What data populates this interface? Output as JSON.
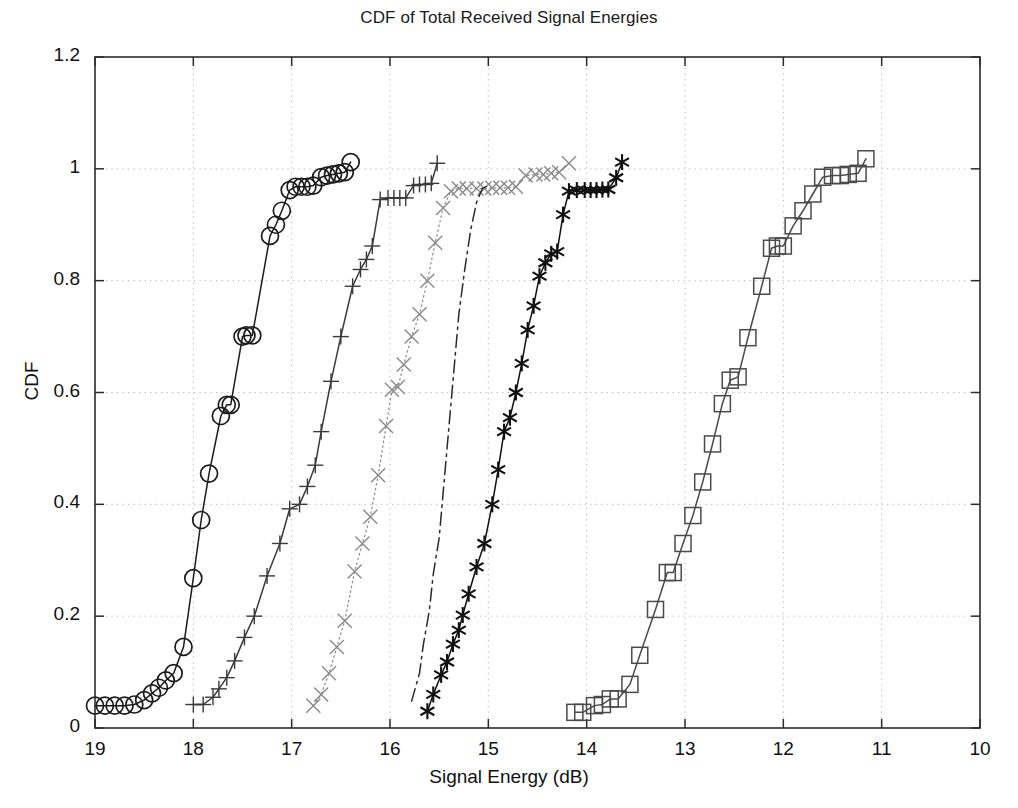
{
  "chart_data": {
    "type": "line",
    "title": "CDF of Total Received Signal Energies",
    "xlabel": "Signal Energy (dB)",
    "ylabel": "CDF",
    "xlim": [
      19,
      10
    ],
    "ylim": [
      0,
      1.2
    ],
    "x_inverted": true,
    "grid": true,
    "legend": "none",
    "xticks": [
      19,
      18,
      17,
      16,
      15,
      14,
      13,
      12,
      11,
      10
    ],
    "xtick_labels": [
      "19",
      "18",
      "17",
      "16",
      "15",
      "14",
      "13",
      "12",
      "11",
      "10"
    ],
    "yticks": [
      0,
      0.2,
      0.4,
      0.6,
      0.8,
      1,
      1.2
    ],
    "ytick_labels": [
      "0",
      "0.2",
      "0.4",
      "0.6",
      "0.8",
      "1",
      "1.2"
    ],
    "series": [
      {
        "name": "series-1",
        "marker": "circle",
        "linestyle": "solid",
        "color": "#1b1b1b",
        "points": [
          [
            19.0,
            0.04
          ],
          [
            18.9,
            0.04
          ],
          [
            18.8,
            0.04
          ],
          [
            18.7,
            0.04
          ],
          [
            18.6,
            0.042
          ],
          [
            18.5,
            0.05
          ],
          [
            18.42,
            0.062
          ],
          [
            18.35,
            0.072
          ],
          [
            18.28,
            0.085
          ],
          [
            18.2,
            0.098
          ],
          [
            18.1,
            0.145
          ],
          [
            18.0,
            0.268
          ],
          [
            17.92,
            0.372
          ],
          [
            17.84,
            0.455
          ],
          [
            17.72,
            0.558
          ],
          [
            17.66,
            0.578
          ],
          [
            17.62,
            0.578
          ],
          [
            17.5,
            0.7
          ],
          [
            17.46,
            0.702
          ],
          [
            17.4,
            0.702
          ],
          [
            17.22,
            0.88
          ],
          [
            17.16,
            0.9
          ],
          [
            17.1,
            0.925
          ],
          [
            17.02,
            0.962
          ],
          [
            16.96,
            0.968
          ],
          [
            16.9,
            0.968
          ],
          [
            16.84,
            0.968
          ],
          [
            16.78,
            0.97
          ],
          [
            16.7,
            0.985
          ],
          [
            16.64,
            0.988
          ],
          [
            16.58,
            0.99
          ],
          [
            16.52,
            0.992
          ],
          [
            16.46,
            0.994
          ],
          [
            16.4,
            1.012
          ]
        ]
      },
      {
        "name": "series-2",
        "marker": "plus",
        "linestyle": "solid",
        "color": "#3a3a3a",
        "points": [
          [
            18.0,
            0.042
          ],
          [
            17.9,
            0.042
          ],
          [
            17.8,
            0.055
          ],
          [
            17.74,
            0.07
          ],
          [
            17.66,
            0.09
          ],
          [
            17.58,
            0.12
          ],
          [
            17.48,
            0.162
          ],
          [
            17.38,
            0.2
          ],
          [
            17.25,
            0.272
          ],
          [
            17.12,
            0.33
          ],
          [
            17.02,
            0.392
          ],
          [
            16.92,
            0.4
          ],
          [
            16.84,
            0.432
          ],
          [
            16.76,
            0.47
          ],
          [
            16.7,
            0.53
          ],
          [
            16.6,
            0.62
          ],
          [
            16.5,
            0.7
          ],
          [
            16.38,
            0.79
          ],
          [
            16.3,
            0.82
          ],
          [
            16.24,
            0.838
          ],
          [
            16.18,
            0.862
          ],
          [
            16.1,
            0.945
          ],
          [
            16.02,
            0.948
          ],
          [
            15.96,
            0.948
          ],
          [
            15.9,
            0.948
          ],
          [
            15.84,
            0.948
          ],
          [
            15.76,
            0.97
          ],
          [
            15.7,
            0.972
          ],
          [
            15.64,
            0.972
          ],
          [
            15.58,
            0.974
          ],
          [
            15.52,
            1.01
          ]
        ]
      },
      {
        "name": "series-3",
        "marker": "x",
        "linestyle": "dotted",
        "color": "#8a8a8a",
        "points": [
          [
            16.78,
            0.04
          ],
          [
            16.7,
            0.06
          ],
          [
            16.62,
            0.098
          ],
          [
            16.54,
            0.145
          ],
          [
            16.46,
            0.192
          ],
          [
            16.36,
            0.28
          ],
          [
            16.28,
            0.33
          ],
          [
            16.2,
            0.378
          ],
          [
            16.12,
            0.452
          ],
          [
            16.04,
            0.54
          ],
          [
            15.98,
            0.605
          ],
          [
            15.92,
            0.61
          ],
          [
            15.86,
            0.65
          ],
          [
            15.78,
            0.7
          ],
          [
            15.7,
            0.74
          ],
          [
            15.62,
            0.8
          ],
          [
            15.54,
            0.868
          ],
          [
            15.46,
            0.93
          ],
          [
            15.38,
            0.96
          ],
          [
            15.3,
            0.965
          ],
          [
            15.22,
            0.965
          ],
          [
            15.12,
            0.965
          ],
          [
            15.04,
            0.965
          ],
          [
            14.96,
            0.966
          ],
          [
            14.88,
            0.966
          ],
          [
            14.8,
            0.966
          ],
          [
            14.72,
            0.968
          ],
          [
            14.62,
            0.988
          ],
          [
            14.52,
            0.99
          ],
          [
            14.44,
            0.99
          ],
          [
            14.36,
            0.992
          ],
          [
            14.28,
            0.994
          ],
          [
            14.18,
            1.01
          ]
        ]
      },
      {
        "name": "series-4",
        "marker": "none",
        "linestyle": "dashdot",
        "color": "#2a2a2a",
        "points": [
          [
            15.78,
            0.048
          ],
          [
            15.7,
            0.098
          ],
          [
            15.66,
            0.15
          ],
          [
            15.6,
            0.21
          ],
          [
            15.56,
            0.275
          ],
          [
            15.5,
            0.34
          ],
          [
            15.46,
            0.42
          ],
          [
            15.42,
            0.5
          ],
          [
            15.38,
            0.58
          ],
          [
            15.34,
            0.66
          ],
          [
            15.3,
            0.74
          ],
          [
            15.24,
            0.82
          ],
          [
            15.18,
            0.89
          ],
          [
            15.12,
            0.94
          ],
          [
            15.06,
            0.965
          ],
          [
            15.0,
            0.97
          ]
        ]
      },
      {
        "name": "series-5",
        "marker": "asterisk",
        "linestyle": "solid",
        "color": "#101010",
        "points": [
          [
            15.62,
            0.03
          ],
          [
            15.56,
            0.06
          ],
          [
            15.48,
            0.095
          ],
          [
            15.42,
            0.118
          ],
          [
            15.36,
            0.15
          ],
          [
            15.3,
            0.175
          ],
          [
            15.26,
            0.202
          ],
          [
            15.2,
            0.24
          ],
          [
            15.12,
            0.288
          ],
          [
            15.04,
            0.33
          ],
          [
            14.96,
            0.4
          ],
          [
            14.9,
            0.462
          ],
          [
            14.84,
            0.53
          ],
          [
            14.78,
            0.555
          ],
          [
            14.72,
            0.6
          ],
          [
            14.66,
            0.652
          ],
          [
            14.6,
            0.712
          ],
          [
            14.54,
            0.755
          ],
          [
            14.48,
            0.808
          ],
          [
            14.42,
            0.832
          ],
          [
            14.36,
            0.848
          ],
          [
            14.3,
            0.852
          ],
          [
            14.24,
            0.918
          ],
          [
            14.18,
            0.96
          ],
          [
            14.1,
            0.962
          ],
          [
            14.02,
            0.962
          ],
          [
            13.96,
            0.962
          ],
          [
            13.9,
            0.962
          ],
          [
            13.84,
            0.963
          ],
          [
            13.78,
            0.963
          ],
          [
            13.7,
            0.984
          ],
          [
            13.64,
            1.012
          ]
        ]
      },
      {
        "name": "series-6",
        "marker": "square",
        "linestyle": "solid",
        "color": "#4a4a4a",
        "points": [
          [
            14.12,
            0.028
          ],
          [
            14.04,
            0.028
          ],
          [
            13.92,
            0.04
          ],
          [
            13.84,
            0.042
          ],
          [
            13.76,
            0.052
          ],
          [
            13.68,
            0.052
          ],
          [
            13.56,
            0.078
          ],
          [
            13.46,
            0.13
          ],
          [
            13.3,
            0.212
          ],
          [
            13.18,
            0.278
          ],
          [
            13.12,
            0.278
          ],
          [
            13.02,
            0.33
          ],
          [
            12.92,
            0.38
          ],
          [
            12.82,
            0.44
          ],
          [
            12.72,
            0.508
          ],
          [
            12.62,
            0.58
          ],
          [
            12.54,
            0.622
          ],
          [
            12.46,
            0.628
          ],
          [
            12.36,
            0.698
          ],
          [
            12.22,
            0.79
          ],
          [
            12.12,
            0.858
          ],
          [
            12.06,
            0.862
          ],
          [
            12.0,
            0.862
          ],
          [
            11.9,
            0.898
          ],
          [
            11.8,
            0.925
          ],
          [
            11.7,
            0.955
          ],
          [
            11.6,
            0.985
          ],
          [
            11.5,
            0.988
          ],
          [
            11.42,
            0.988
          ],
          [
            11.34,
            0.99
          ],
          [
            11.24,
            0.992
          ],
          [
            11.16,
            1.018
          ]
        ]
      }
    ]
  }
}
